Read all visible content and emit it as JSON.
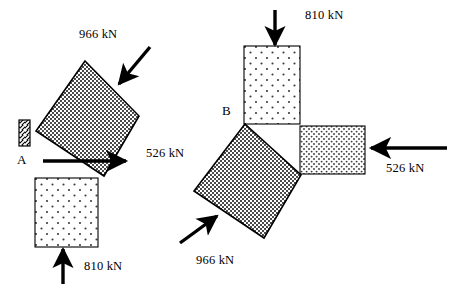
{
  "figure": {
    "width": 456,
    "height": 300,
    "background": "#ffffff",
    "stroke_color": "#000000",
    "arrow_color": "#000000"
  },
  "diagrams": [
    {
      "id": "left",
      "name": "left-diagram",
      "point_label": "A",
      "point_label_pos": {
        "x": 17,
        "y": 152
      },
      "support": {
        "name": "hatched-support",
        "x": 19,
        "y": 120,
        "width": 11,
        "height": 26,
        "hatch": "diagonal"
      },
      "rotated_square": {
        "name": "rotated-square-block",
        "fill": "dense-stipple",
        "vertices": [
          {
            "x": 85,
            "y": 61
          },
          {
            "x": 139,
            "y": 116
          },
          {
            "x": 104,
            "y": 176
          },
          {
            "x": 36,
            "y": 131
          }
        ]
      },
      "plate": {
        "name": "lower-bearing-plate",
        "fill": "sparse-dots",
        "x": 35,
        "y": 178,
        "width": 63,
        "height": 69
      },
      "forces": [
        {
          "name": "force-966-diagonal",
          "value": "966 kN",
          "label_pos": {
            "x": 79,
            "y": 34
          },
          "from": {
            "x": 150,
            "y": 47
          },
          "to": {
            "x": 119,
            "y": 84
          },
          "direction": "down-left"
        },
        {
          "name": "force-526-horizontal",
          "value": "526 kN",
          "label_pos": {
            "x": 146,
            "y": 153
          },
          "from": {
            "x": 43,
            "y": 161
          },
          "to": {
            "x": 127,
            "y": 161
          },
          "direction": "right"
        },
        {
          "name": "force-810-vertical",
          "value": "810 kN",
          "label_pos": {
            "x": 84,
            "y": 266
          },
          "from": {
            "x": 63,
            "y": 284
          },
          "to": {
            "x": 63,
            "y": 248
          },
          "direction": "up"
        }
      ]
    },
    {
      "id": "right",
      "name": "right-diagram",
      "point_label": "B",
      "point_label_pos": {
        "x": 222,
        "y": 103
      },
      "rotated_square": {
        "name": "rotated-square-block",
        "fill": "dense-stipple",
        "vertices": [
          {
            "x": 245,
            "y": 124
          },
          {
            "x": 301,
            "y": 175
          },
          {
            "x": 264,
            "y": 238
          },
          {
            "x": 194,
            "y": 191
          }
        ]
      },
      "plate_top": {
        "name": "top-bearing-plate",
        "fill": "sparse-dots",
        "x": 244,
        "y": 46,
        "width": 56,
        "height": 78
      },
      "plate_right": {
        "name": "right-bearing-plate",
        "fill": "sparse-dots",
        "x": 300,
        "y": 126,
        "width": 65,
        "height": 48
      },
      "forces": [
        {
          "name": "force-810-vertical",
          "value": "810 kN",
          "label_pos": {
            "x": 305,
            "y": 14
          },
          "from": {
            "x": 275,
            "y": 10
          },
          "to": {
            "x": 275,
            "y": 46
          },
          "direction": "down"
        },
        {
          "name": "force-526-horizontal",
          "value": "526 kN",
          "label_pos": {
            "x": 386,
            "y": 168
          },
          "from": {
            "x": 447,
            "y": 148
          },
          "to": {
            "x": 370,
            "y": 148
          },
          "direction": "left"
        },
        {
          "name": "force-966-diagonal",
          "value": "966 kN",
          "label_pos": {
            "x": 196,
            "y": 260
          },
          "from": {
            "x": 180,
            "y": 243
          },
          "to": {
            "x": 218,
            "y": 215
          },
          "direction": "up-right"
        }
      ]
    }
  ]
}
